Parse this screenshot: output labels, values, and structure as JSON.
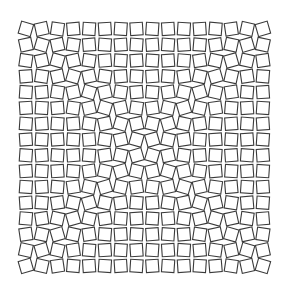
{
  "figure": {
    "background": "#ffffff",
    "stroke": "#3a3a3a",
    "grid": {
      "cols": 16,
      "rows": 16,
      "x0": 18,
      "y0": 21,
      "cell": 15.8,
      "tile": 12.5
    },
    "blocks": 4,
    "rotation_deg_max": 12
  }
}
